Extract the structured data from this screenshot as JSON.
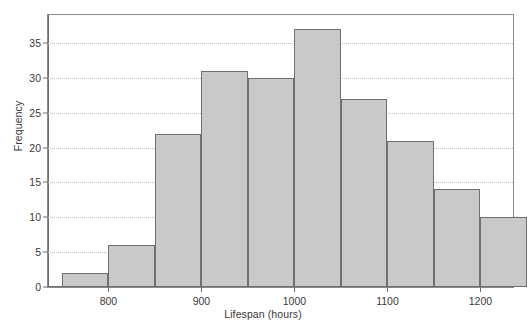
{
  "chart_data": {
    "type": "bar",
    "title": "",
    "xlabel": "Lifespan (hours)",
    "ylabel": "Frequency",
    "grid": true,
    "legend": false,
    "bin_width": 50,
    "xlim": [
      735,
      1235
    ],
    "ylim": [
      0,
      39
    ],
    "xticks": [
      800,
      900,
      1000,
      1100,
      1200
    ],
    "xtick_labels": [
      "800",
      "900",
      "1000",
      "1100",
      "1200"
    ],
    "yticks": [
      0,
      5,
      10,
      15,
      20,
      25,
      30,
      35
    ],
    "ytick_labels": [
      "0",
      "5",
      "10",
      "15",
      "20",
      "25",
      "30",
      "35"
    ],
    "bins": [
      {
        "start": 750,
        "end": 800,
        "value": 2
      },
      {
        "start": 800,
        "end": 850,
        "value": 6
      },
      {
        "start": 850,
        "end": 900,
        "value": 22
      },
      {
        "start": 900,
        "end": 950,
        "value": 31
      },
      {
        "start": 950,
        "end": 1000,
        "value": 30
      },
      {
        "start": 1000,
        "end": 1050,
        "value": 37
      },
      {
        "start": 1050,
        "end": 1100,
        "value": 27
      },
      {
        "start": 1100,
        "end": 1150,
        "value": 21
      },
      {
        "start": 1150,
        "end": 1200,
        "value": 14
      },
      {
        "start": 1200,
        "end": 1250,
        "value": 10
      }
    ],
    "categories": [
      "750-800",
      "800-850",
      "850-900",
      "900-950",
      "950-1000",
      "1000-1050",
      "1050-1100",
      "1100-1150",
      "1150-1200",
      "1200-1250"
    ],
    "values": [
      2,
      6,
      22,
      31,
      30,
      37,
      27,
      21,
      14,
      10
    ],
    "colors": {
      "bar_fill": "#c9c9c9",
      "bar_edge": "#6f6f6f",
      "grid": "#bdbdc6",
      "axis": "#6f6f6f",
      "text": "#3a3a3a"
    }
  }
}
